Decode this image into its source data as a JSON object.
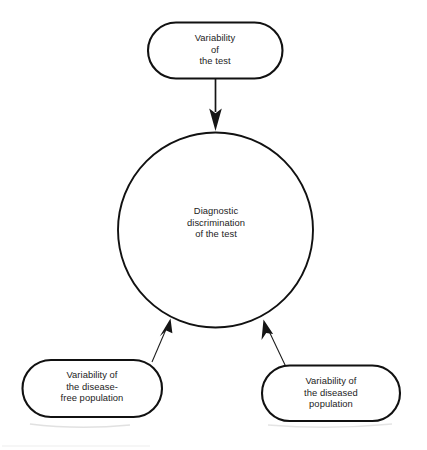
{
  "diagram": {
    "title": "Diagnostic discrimination of the test",
    "type": "flow-diagram",
    "background_color": "#ffffff",
    "stroke_color": "#111111",
    "text_color": "#1c1c1c",
    "nodes": {
      "top": {
        "id": "variability-of-the-test",
        "shape": "stadium",
        "text": "Variability\nof\nthe test",
        "lines": [
          "Variability",
          "of",
          "the test"
        ]
      },
      "center": {
        "id": "diagnostic-discrimination",
        "shape": "circle",
        "text": "Diagnostic\ndiscrimination\nof the test",
        "lines": [
          "Diagnostic",
          "discrimination",
          "of the test"
        ]
      },
      "bottom_left": {
        "id": "variability-disease-free-population",
        "shape": "stadium",
        "text": "Variability of\nthe disease-\nfree population",
        "lines": [
          "Variability of",
          "the disease-",
          "free population"
        ]
      },
      "bottom_right": {
        "id": "variability-diseased-population",
        "shape": "stadium",
        "text": "Variability of\nthe diseased\npopulation",
        "lines": [
          "Variability of",
          "the diseased",
          "population"
        ]
      }
    },
    "edges": [
      {
        "id": "edge-top-to-center",
        "from": "variability-of-the-test",
        "to": "diagnostic-discrimination",
        "style": "solid-thick",
        "arrow": "filled-triangle",
        "direction": "down"
      },
      {
        "id": "edge-bottom-left-to-center",
        "from": "variability-disease-free-population",
        "to": "diagnostic-discrimination",
        "style": "solid-thin",
        "arrow": "filled-triangle",
        "direction": "up-right"
      },
      {
        "id": "edge-bottom-right-to-center",
        "from": "variability-diseased-population",
        "to": "diagnostic-discrimination",
        "style": "solid-thin",
        "arrow": "filled-triangle",
        "direction": "up-left"
      }
    ]
  }
}
